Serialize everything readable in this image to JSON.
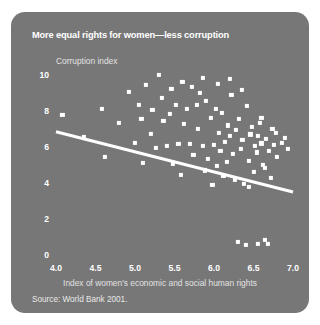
{
  "figure": {
    "title": "More equal rights for women—less corruption",
    "source": "Source: World Bank 2001.",
    "background_color": "#777777",
    "foreground_color": "#ffffff"
  },
  "chart_data": {
    "type": "scatter",
    "title": "More equal rights for women—less corruption",
    "xlabel": "Index of women's economic and social human rights",
    "ylabel": "Corruption index",
    "xlim": [
      4.0,
      7.0
    ],
    "ylim": [
      0,
      10
    ],
    "xticks": [
      "4.0",
      "4.5",
      "5.0",
      "5.5",
      "6.0",
      "6.5",
      "7.0"
    ],
    "yticks": [
      "0",
      "2",
      "4",
      "6",
      "8",
      "10"
    ],
    "grid": false,
    "legend": null,
    "marker": "square",
    "marker_color": "#ffffff",
    "trendline": {
      "label": "linear fit",
      "color": "#ffffff",
      "x": [
        4.0,
        7.0
      ],
      "y": [
        6.85,
        3.5
      ]
    },
    "points": [
      [
        4.08,
        7.8
      ],
      [
        4.58,
        8.1
      ],
      [
        4.62,
        5.45
      ],
      [
        4.92,
        9.05
      ],
      [
        5.0,
        6.25
      ],
      [
        5.05,
        8.35
      ],
      [
        5.08,
        7.55
      ],
      [
        5.14,
        9.45
      ],
      [
        5.2,
        6.75
      ],
      [
        5.22,
        8.05
      ],
      [
        5.3,
        10.0
      ],
      [
        5.34,
        8.75
      ],
      [
        5.36,
        7.45
      ],
      [
        5.4,
        6.05
      ],
      [
        5.46,
        9.25
      ],
      [
        5.52,
        8.35
      ],
      [
        5.55,
        6.15
      ],
      [
        5.58,
        4.45
      ],
      [
        5.6,
        9.6
      ],
      [
        5.62,
        7.3
      ],
      [
        5.66,
        8.1
      ],
      [
        5.7,
        6.15
      ],
      [
        5.74,
        5.55
      ],
      [
        5.78,
        8.35
      ],
      [
        5.8,
        7.0
      ],
      [
        5.82,
        9.0
      ],
      [
        5.86,
        6.05
      ],
      [
        5.88,
        4.7
      ],
      [
        5.9,
        8.55
      ],
      [
        5.92,
        5.35
      ],
      [
        5.96,
        7.6
      ],
      [
        6.0,
        6.1
      ],
      [
        6.02,
        8.1
      ],
      [
        6.04,
        4.95
      ],
      [
        6.06,
        6.8
      ],
      [
        6.08,
        5.8
      ],
      [
        6.1,
        7.9
      ],
      [
        6.12,
        4.4
      ],
      [
        6.14,
        6.3
      ],
      [
        6.16,
        5.15
      ],
      [
        6.18,
        7.2
      ],
      [
        6.2,
        6.6
      ],
      [
        6.22,
        8.9
      ],
      [
        6.24,
        5.6
      ],
      [
        6.26,
        4.2
      ],
      [
        6.28,
        6.95
      ],
      [
        6.3,
        0.75
      ],
      [
        6.32,
        7.55
      ],
      [
        6.34,
        5.9
      ],
      [
        6.36,
        6.4
      ],
      [
        6.38,
        3.95
      ],
      [
        6.4,
        0.55
      ],
      [
        6.42,
        8.3
      ],
      [
        6.44,
        5.25
      ],
      [
        6.46,
        6.7
      ],
      [
        6.48,
        7.1
      ],
      [
        6.5,
        4.6
      ],
      [
        6.52,
        6.05
      ],
      [
        6.54,
        5.7
      ],
      [
        6.56,
        0.6
      ],
      [
        6.58,
        7.35
      ],
      [
        6.6,
        6.2
      ],
      [
        6.62,
        5.0
      ],
      [
        6.64,
        0.85
      ],
      [
        6.66,
        6.45
      ],
      [
        6.68,
        0.6
      ],
      [
        6.7,
        5.8
      ],
      [
        6.72,
        4.3
      ],
      [
        6.74,
        7.0
      ],
      [
        6.76,
        6.1
      ],
      [
        6.8,
        5.45
      ],
      [
        6.86,
        6.25
      ],
      [
        6.9,
        6.5
      ],
      [
        6.94,
        5.9
      ],
      [
        4.35,
        6.55
      ],
      [
        4.8,
        7.35
      ],
      [
        5.1,
        5.1
      ],
      [
        5.44,
        7.85
      ],
      [
        5.72,
        9.35
      ],
      [
        6.05,
        9.5
      ],
      [
        6.35,
        9.15
      ],
      [
        5.26,
        5.95
      ],
      [
        5.48,
        5.05
      ],
      [
        5.98,
        3.9
      ],
      [
        6.44,
        3.8
      ],
      [
        6.64,
        4.85
      ],
      [
        6.2,
        9.8
      ],
      [
        5.86,
        9.85
      ],
      [
        6.56,
        6.6
      ],
      [
        6.6,
        7.6
      ],
      [
        6.78,
        6.8
      ]
    ]
  }
}
